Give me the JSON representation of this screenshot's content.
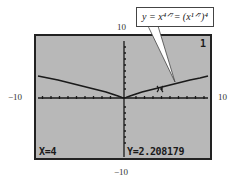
{
  "figure_label": "",
  "callout": {
    "text": "y = x⁴ᐟ⁷= (x¹ᐟ⁷)⁴"
  },
  "window": {
    "ymax_label": "10",
    "xmin_label": "−10",
    "xmax_label": "10",
    "ymin_label": "−10"
  },
  "screen": {
    "plot_number": "1",
    "x_readout": "X=4",
    "y_readout": "Y=2.208179",
    "background_color": "#b8b8b8",
    "trace_color": "#1a1a1a"
  },
  "function": {
    "expression": "y = x^(4/7) = (x^(1/7))^4",
    "trace_x": 4,
    "trace_y": 2.208179
  }
}
